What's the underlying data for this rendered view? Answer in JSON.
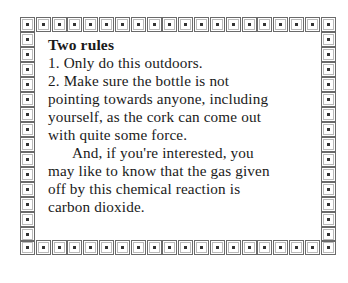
{
  "card": {
    "title": "Two rules",
    "lines": [
      "1.  Only do this outdoors.",
      "2.  Make sure the bottle is not",
      "pointing towards anyone, including",
      "yourself, as the cork can come out",
      "with quite some force.",
      "And, if you're interested, you",
      "may like to know that the gas given",
      "off by this chemical reaction is",
      "carbon dioxide."
    ]
  },
  "border": {
    "style": "dotted-square-tiles",
    "top_count": 20,
    "bottom_count": 20,
    "side_count": 14,
    "tile_border_color": "#6a6a6a",
    "dot_color": "#333333"
  }
}
